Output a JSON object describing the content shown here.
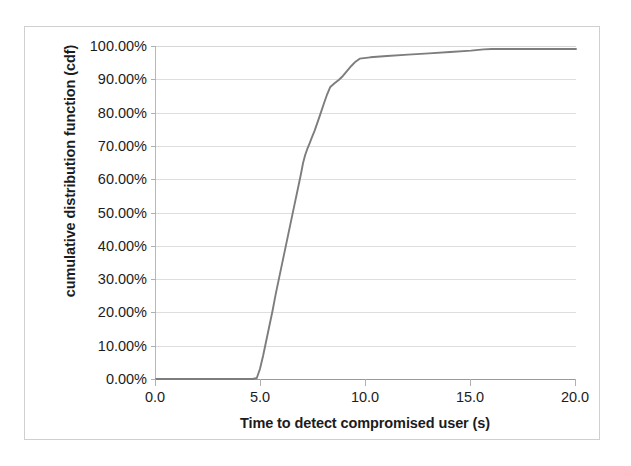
{
  "chart_data": {
    "type": "line",
    "title": "",
    "xlabel": "Time to detect compromised user (s)",
    "ylabel": "cumulative distribution function (cdf)",
    "xlim": [
      0.0,
      20.0
    ],
    "ylim": [
      0.0,
      1.0
    ],
    "xticks": [
      0.0,
      5.0,
      10.0,
      15.0,
      20.0
    ],
    "xticklabels": [
      "0.0",
      "5.0",
      "10.0",
      "15.0",
      "20.0"
    ],
    "yticks": [
      0.0,
      0.1,
      0.2,
      0.3,
      0.4,
      0.5,
      0.6,
      0.7,
      0.8,
      0.9,
      1.0
    ],
    "yticklabels": [
      "0.00%",
      "10.00%",
      "20.00%",
      "30.00%",
      "40.00%",
      "50.00%",
      "60.00%",
      "70.00%",
      "80.00%",
      "90.00%",
      "100.00%"
    ],
    "grid": "horizontal",
    "legend": "none",
    "series": [
      {
        "name": "cdf of detection time",
        "color": "#7d7d7d",
        "x": [
          0.0,
          1.0,
          2.0,
          3.0,
          4.0,
          4.6,
          4.8,
          4.95,
          5.1,
          5.25,
          5.4,
          5.55,
          5.7,
          5.85,
          6.0,
          6.1,
          6.2,
          6.3,
          6.4,
          6.5,
          6.6,
          6.7,
          6.8,
          6.9,
          7.0,
          7.1,
          7.2,
          7.3,
          7.4,
          7.55,
          7.7,
          7.85,
          8.0,
          8.15,
          8.3,
          8.5,
          8.7,
          8.9,
          9.1,
          9.3,
          9.5,
          9.7,
          10.2,
          11.0,
          12.0,
          13.0,
          14.0,
          15.0,
          15.6,
          16.0,
          17.0,
          18.0,
          19.0,
          20.0
        ],
        "y": [
          0.0,
          0.0,
          0.0,
          0.0,
          0.0,
          0.0,
          0.003,
          0.03,
          0.07,
          0.115,
          0.16,
          0.205,
          0.255,
          0.3,
          0.345,
          0.375,
          0.405,
          0.435,
          0.465,
          0.495,
          0.525,
          0.555,
          0.585,
          0.615,
          0.648,
          0.672,
          0.69,
          0.705,
          0.722,
          0.745,
          0.772,
          0.8,
          0.828,
          0.855,
          0.877,
          0.888,
          0.898,
          0.91,
          0.925,
          0.94,
          0.953,
          0.962,
          0.966,
          0.97,
          0.974,
          0.978,
          0.982,
          0.986,
          0.99,
          0.991,
          0.991,
          0.991,
          0.991,
          0.991
        ]
      }
    ],
    "annotations": []
  },
  "axes": {
    "y_title": "cumulative distribution function (cdf)",
    "x_title": "Time to detect compromised user (s)",
    "y_labels": [
      "100.00%",
      "90.00%",
      "80.00%",
      "70.00%",
      "60.00%",
      "50.00%",
      "40.00%",
      "30.00%",
      "20.00%",
      "10.00%",
      "0.00%"
    ],
    "x_labels": [
      "0.0",
      "5.0",
      "10.0",
      "15.0",
      "20.0"
    ]
  },
  "style": {
    "line_color": "#7d7d7d",
    "grid_color": "#dedede",
    "axis_color": "#9a9a9a",
    "text_color": "#1c1c1c",
    "background": "#ffffff"
  }
}
